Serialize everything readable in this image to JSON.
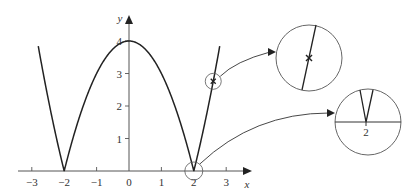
{
  "diagram": {
    "function": "y = |4 - x^2|",
    "axes": {
      "x_label": "x",
      "y_label": "y",
      "x_ticks": [
        {
          "value": -3,
          "label": "−3"
        },
        {
          "value": -2,
          "label": "−2"
        },
        {
          "value": -1,
          "label": "−1"
        },
        {
          "value": 0,
          "label": "0"
        },
        {
          "value": 1,
          "label": "1"
        },
        {
          "value": 2,
          "label": "2"
        },
        {
          "value": 3,
          "label": "3"
        }
      ],
      "y_ticks": [
        {
          "value": 1,
          "label": "1"
        },
        {
          "value": 2,
          "label": "2"
        },
        {
          "value": 3,
          "label": "3"
        },
        {
          "value": 4,
          "label": "4"
        }
      ],
      "x_range": [
        -3.3,
        3.8
      ],
      "y_range": [
        0,
        4.7
      ]
    },
    "curve": {
      "x_domain": [
        -2.8,
        2.8
      ],
      "color": "#222222"
    },
    "highlights": [
      {
        "name": "smooth-point",
        "at_x": 2.6,
        "marker": "x",
        "magnified_description": "straight line segment with cross marker (differentiable point)"
      },
      {
        "name": "corner-point",
        "at_x": 2,
        "magnified_label": "2",
        "magnified_description": "sharp V-shaped corner on the x-axis (non-differentiable point)"
      }
    ],
    "colors": {
      "ink": "#222222",
      "circle": "#555555",
      "background": "#ffffff"
    }
  }
}
